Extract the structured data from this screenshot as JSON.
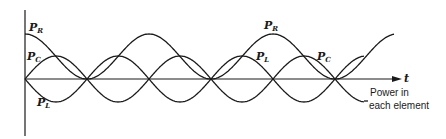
{
  "diagram": {
    "axis": {
      "time_label": "t",
      "note_line1": "Power in",
      "note_line2": "each element"
    },
    "labels": [
      {
        "id": "pr-left",
        "base": "P",
        "sub": "R",
        "x": 29,
        "y": 22
      },
      {
        "id": "pc-left",
        "base": "P",
        "sub": "C",
        "x": 27,
        "y": 51
      },
      {
        "id": "pl-left",
        "base": "P",
        "sub": "L",
        "x": 37,
        "y": 97
      },
      {
        "id": "pr-right",
        "base": "P",
        "sub": "R",
        "x": 264,
        "y": 20
      },
      {
        "id": "pl-right",
        "base": "P",
        "sub": "L",
        "x": 256,
        "y": 51
      },
      {
        "id": "pc-right",
        "base": "P",
        "sub": "C",
        "x": 317,
        "y": 51
      }
    ],
    "geometry": {
      "origin_x": 25,
      "axis_y": 79,
      "axis_end_x": 400,
      "half_period_px": 62,
      "pr_amplitude_px": 45,
      "pcl_amplitude_px": 23,
      "pr_end_x": 394,
      "pcl_end_x": 364
    },
    "colors": {
      "ink": "#1a1a1a",
      "background": "#ffffff"
    }
  }
}
